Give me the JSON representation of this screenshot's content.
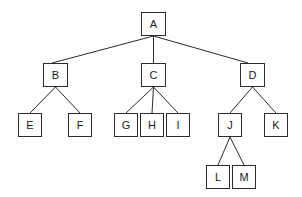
{
  "diagram": {
    "type": "tree",
    "canvas": {
      "width": 302,
      "height": 197
    },
    "style": {
      "background_color": "#ffffff",
      "node_fill_color": "#ffffff",
      "node_border_color": "#2b2b2b",
      "edge_color": "#2b2b2b",
      "label_color": "#1a1a1a",
      "node_border_width": 1,
      "edge_width": 1
    },
    "nodes": [
      {
        "id": "A",
        "label": "A",
        "level": 0,
        "x": 141,
        "y": 12,
        "w": 25,
        "h": 24
      },
      {
        "id": "B",
        "label": "B",
        "level": 1,
        "x": 43,
        "y": 63,
        "w": 25,
        "h": 24
      },
      {
        "id": "C",
        "label": "C",
        "level": 1,
        "x": 141,
        "y": 63,
        "w": 25,
        "h": 24
      },
      {
        "id": "D",
        "label": "D",
        "level": 1,
        "x": 240,
        "y": 63,
        "w": 25,
        "h": 24
      },
      {
        "id": "E",
        "label": "E",
        "level": 2,
        "x": 18,
        "y": 113,
        "w": 24,
        "h": 24
      },
      {
        "id": "F",
        "label": "F",
        "level": 2,
        "x": 68,
        "y": 113,
        "w": 24,
        "h": 24
      },
      {
        "id": "G",
        "label": "G",
        "level": 2,
        "x": 114,
        "y": 113,
        "w": 24,
        "h": 24
      },
      {
        "id": "H",
        "label": "H",
        "level": 2,
        "x": 140,
        "y": 113,
        "w": 24,
        "h": 24
      },
      {
        "id": "I",
        "label": "I",
        "level": 2,
        "x": 166,
        "y": 113,
        "w": 24,
        "h": 24
      },
      {
        "id": "J",
        "label": "J",
        "level": 2,
        "x": 218,
        "y": 113,
        "w": 24,
        "h": 24
      },
      {
        "id": "K",
        "label": "K",
        "level": 2,
        "x": 264,
        "y": 113,
        "w": 24,
        "h": 24
      },
      {
        "id": "L",
        "label": "L",
        "level": 3,
        "x": 206,
        "y": 165,
        "w": 24,
        "h": 24
      },
      {
        "id": "M",
        "label": "M",
        "level": 3,
        "x": 232,
        "y": 165,
        "w": 24,
        "h": 24
      }
    ],
    "edges": [
      {
        "from": "A",
        "to": "B",
        "x1": 153.5,
        "y1": 36,
        "x2": 52,
        "y2": 63
      },
      {
        "from": "A",
        "to": "C",
        "x1": 153.5,
        "y1": 36,
        "x2": 153.5,
        "y2": 63
      },
      {
        "from": "A",
        "to": "D",
        "x1": 153.5,
        "y1": 36,
        "x2": 248,
        "y2": 63
      },
      {
        "from": "B",
        "to": "E",
        "x1": 55.5,
        "y1": 87,
        "x2": 30,
        "y2": 113
      },
      {
        "from": "B",
        "to": "F",
        "x1": 55.5,
        "y1": 87,
        "x2": 80,
        "y2": 113
      },
      {
        "from": "C",
        "to": "G",
        "x1": 153.5,
        "y1": 87,
        "x2": 126,
        "y2": 113
      },
      {
        "from": "C",
        "to": "H",
        "x1": 153.5,
        "y1": 87,
        "x2": 152,
        "y2": 113
      },
      {
        "from": "C",
        "to": "I",
        "x1": 153.5,
        "y1": 87,
        "x2": 178,
        "y2": 113
      },
      {
        "from": "D",
        "to": "J",
        "x1": 252.5,
        "y1": 87,
        "x2": 230,
        "y2": 113
      },
      {
        "from": "D",
        "to": "K",
        "x1": 252.5,
        "y1": 87,
        "x2": 276,
        "y2": 113
      },
      {
        "from": "J",
        "to": "L",
        "x1": 230,
        "y1": 137,
        "x2": 218,
        "y2": 165
      },
      {
        "from": "J",
        "to": "M",
        "x1": 230,
        "y1": 137,
        "x2": 244,
        "y2": 165
      }
    ]
  }
}
